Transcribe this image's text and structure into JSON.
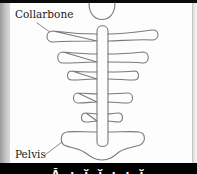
{
  "diagram": {
    "labels": {
      "collarbone": "Collarbone",
      "pelvis": "Pelvis"
    },
    "parts": [
      "head",
      "collarbone",
      "rib-1",
      "rib-2",
      "rib-3",
      "rib-4",
      "spine",
      "pelvis"
    ],
    "colors": {
      "outline": "#7a7a7a",
      "background": "#fdfdfd",
      "label_text": "#1a1a1a"
    }
  },
  "footer": {
    "caption_fragment": "Ă ɩ ĭ ĭ ɩ ɩ ĭ"
  }
}
